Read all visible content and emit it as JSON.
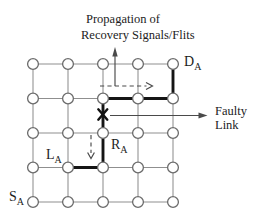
{
  "figure": {
    "width": 260,
    "height": 223
  },
  "colors": {
    "background": "#ffffff",
    "grid_line": "#8f8f8f",
    "node_fill": "#ffffff",
    "node_stroke": "#6b6b6b",
    "bold_path": "#151515",
    "faulty_mark": "#111111",
    "arrow": "#4a4a4a",
    "text": "#1c1c1c"
  },
  "diagram": {
    "type": "mesh-network",
    "grid": {
      "columns": 5,
      "rows": 5,
      "col_x": [
        33,
        68,
        103,
        138,
        173
      ],
      "row_y": [
        64,
        98.5,
        133,
        167.5,
        202
      ],
      "node_radius": 5.4
    },
    "bold_path_segments": [
      {
        "from": [
          4,
          0
        ],
        "to": [
          4,
          1
        ]
      },
      {
        "from": [
          2,
          1
        ],
        "to": [
          4,
          1
        ]
      },
      {
        "from": [
          2,
          1
        ],
        "to": [
          2,
          2
        ]
      },
      {
        "from": [
          2,
          2
        ],
        "to": [
          2,
          3
        ]
      },
      {
        "from": [
          1,
          3
        ],
        "to": [
          2,
          3
        ]
      }
    ],
    "faulty_mark": {
      "symbol": "X",
      "cx": 102.8,
      "cy": 114.5,
      "half_width": 4.5,
      "half_height": 5.2
    },
    "arrows": [
      {
        "name": "recovery-up-arrow",
        "style": "solid",
        "x1": 115,
        "y1": 86,
        "x2": 115,
        "y2": 56,
        "head": "115,47 112.3,56.5 117.7,56.5",
        "head_type": "fill"
      },
      {
        "name": "recovery-dashed-right-arrow",
        "style": "dashed",
        "x1": 100,
        "y1": 86,
        "x2": 146.5,
        "y2": 86,
        "head": "146,82.5 152.5,86 146,89.5",
        "head_type": "stroke"
      },
      {
        "name": "recovery-dashed-down-arrow",
        "style": "dashed",
        "x1": 91,
        "y1": 135,
        "x2": 91,
        "y2": 153,
        "head": "87.6,152.5 91,158.5 94.4,152.5",
        "head_type": "stroke"
      },
      {
        "name": "faulty-link-pointer-arrow",
        "style": "solid",
        "x1": 110,
        "y1": 115.5,
        "x2": 199,
        "y2": 115.5,
        "head": "207.5,115.5 198.5,112.4 198.5,118.6",
        "head_type": "fill"
      }
    ],
    "text_labels": [
      {
        "name": "propagation-label-line1",
        "text": "Propagation of",
        "x": 86,
        "y": 23,
        "size": 12.5
      },
      {
        "name": "propagation-label-line2",
        "text": "Recovery Signals/Flits",
        "x": 81,
        "y": 39,
        "size": 12.5
      },
      {
        "name": "faulty-link-label-line1",
        "text": "Faulty",
        "x": 215,
        "y": 114.5,
        "size": 12.5
      },
      {
        "name": "faulty-link-label-line2",
        "text": "Link",
        "x": 215,
        "y": 129,
        "size": 12.5
      },
      {
        "name": "destination-node-label",
        "text": "D",
        "sub": "A",
        "x": 184,
        "y": 66,
        "size": 14
      },
      {
        "name": "current-router-label",
        "text": "R",
        "sub": "A",
        "x": 111,
        "y": 149,
        "size": 14
      },
      {
        "name": "last-router-label",
        "text": "L",
        "sub": "A",
        "x": 46,
        "y": 159,
        "size": 14
      },
      {
        "name": "source-node-label",
        "text": "S",
        "sub": "A",
        "x": 9,
        "y": 201,
        "size": 14
      }
    ]
  }
}
